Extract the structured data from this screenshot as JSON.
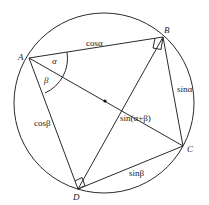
{
  "diagram": {
    "circle": {
      "cx": 104,
      "cy": 103,
      "r": 90
    },
    "center_dot": {
      "x": 105,
      "y": 101
    },
    "points": {
      "A": {
        "label": "A",
        "x": 29,
        "y": 58
      },
      "B": {
        "label": "B",
        "x": 163,
        "y": 37
      },
      "C": {
        "label": "C",
        "x": 183,
        "y": 146
      },
      "D": {
        "label": "D",
        "x": 78,
        "y": 189
      }
    },
    "segments": [
      {
        "from": "A",
        "to": "B",
        "label": "cosα"
      },
      {
        "from": "B",
        "to": "C",
        "label": "sinα"
      },
      {
        "from": "C",
        "to": "D",
        "label": "sinβ"
      },
      {
        "from": "D",
        "to": "A",
        "label": "cosβ"
      },
      {
        "from": "A",
        "to": "C",
        "label": "sin(α+β)"
      },
      {
        "from": "B",
        "to": "D",
        "label": ""
      }
    ],
    "angles": {
      "alpha": "α",
      "beta": "β"
    },
    "labels": {
      "cos_alpha": "cosα",
      "sin_alpha": "sinα",
      "sin_alpha_plus_beta": "sin(α+β)",
      "cos_beta": "cosβ",
      "sin_beta": "sinβ",
      "alpha": "α",
      "beta": "β",
      "A": "A",
      "B": "B",
      "C": "C",
      "D": "D"
    },
    "right_angles": [
      "B",
      "D"
    ]
  }
}
